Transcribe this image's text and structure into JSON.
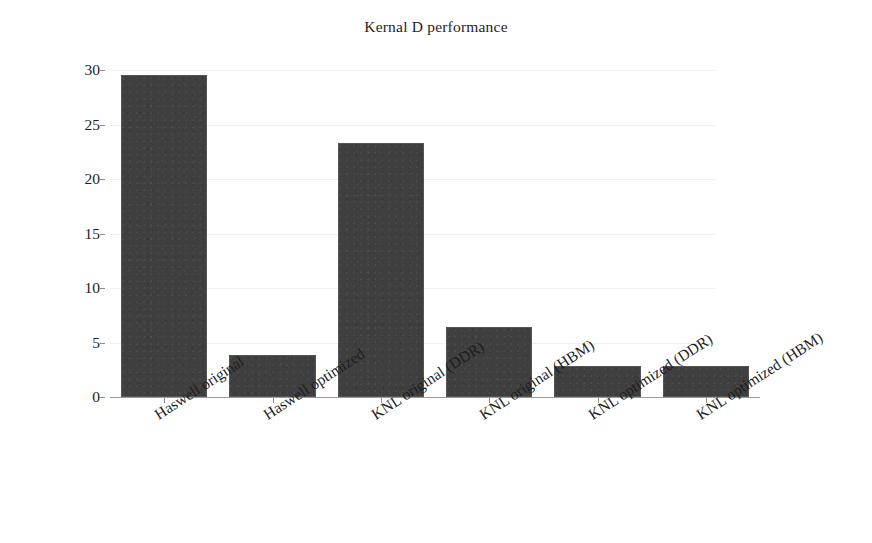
{
  "chart_data": {
    "type": "bar",
    "title": "Kernal D performance",
    "xlabel": "",
    "ylabel": "Walltime (sec)",
    "categories": [
      "Haswell original",
      "Haswell optimized",
      "KNL original (DDR)",
      "KNL original (HBM)",
      "KNL optimized (DDR)",
      "KNL optimized (HBM)"
    ],
    "values": [
      29.5,
      3.85,
      23.3,
      6.4,
      2.85,
      2.85
    ],
    "ylim": [
      0,
      30
    ],
    "yticks": [
      0,
      5,
      10,
      15,
      20,
      25,
      30
    ],
    "ytick_labels": [
      "0",
      "5",
      "10",
      "15",
      "20",
      "25",
      "30"
    ],
    "grid": true,
    "legend": false,
    "bar_color": "#3f3f3f",
    "grid_color": "#f0f0f0",
    "axis_color": "#9a9a9a",
    "background_color": "#ffffff",
    "text_color": "#1e1e1e"
  }
}
